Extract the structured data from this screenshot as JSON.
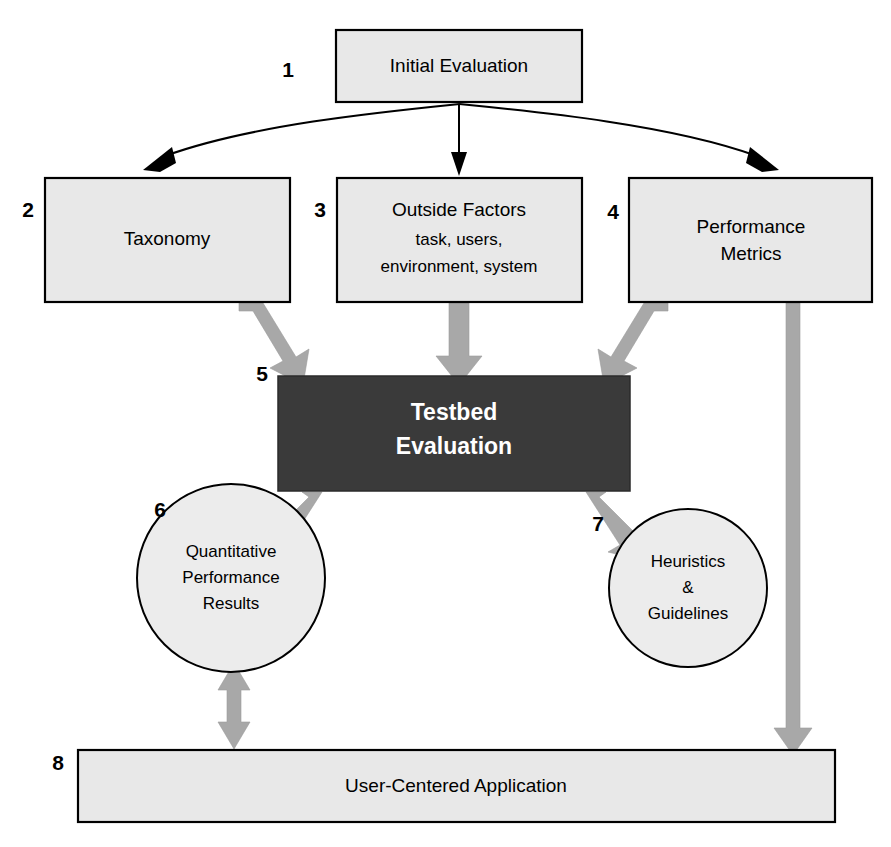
{
  "diagram": {
    "colors": {
      "box_fill": "#e8e8e8",
      "box_stroke": "#000000",
      "dark_box_fill": "#3a3a3a",
      "dark_box_text": "#ffffff",
      "circle_fill": "#ececec",
      "gray_arrow": "#a8a8a8",
      "thin_arrow": "#000000",
      "background": "#ffffff"
    },
    "nodes": [
      {
        "id": "initial-evaluation",
        "step": "1",
        "shape": "rectangle",
        "label": "Initial Evaluation",
        "sublabel": ""
      },
      {
        "id": "taxonomy",
        "step": "2",
        "shape": "rectangle",
        "label": "Taxonomy",
        "sublabel": ""
      },
      {
        "id": "outside-factors",
        "step": "3",
        "shape": "rectangle",
        "label": "Outside Factors",
        "sublabel_line1": "task, users,",
        "sublabel_line2": "environment, system"
      },
      {
        "id": "performance-metrics",
        "step": "4",
        "shape": "rectangle",
        "label_line1": "Performance",
        "label_line2": "Metrics"
      },
      {
        "id": "testbed-evaluation",
        "step": "5",
        "shape": "rectangle-dark",
        "label_line1": "Testbed",
        "label_line2": "Evaluation"
      },
      {
        "id": "quantitative-performance-results",
        "step": "6",
        "shape": "circle",
        "label_line1": "Quantitative",
        "label_line2": "Performance",
        "label_line3": "Results"
      },
      {
        "id": "heuristics-guidelines",
        "step": "7",
        "shape": "circle",
        "label_line1": "Heuristics",
        "label_line2": "&",
        "label_line3": "Guidelines"
      },
      {
        "id": "user-centered-application",
        "step": "8",
        "shape": "rectangle-wide",
        "label": "User-Centered Application",
        "sublabel": ""
      }
    ],
    "edges": [
      {
        "id": "edge-1-2",
        "from": "initial-evaluation",
        "to": "taxonomy",
        "style": "thin-curved",
        "direction": "one-way"
      },
      {
        "id": "edge-1-3",
        "from": "initial-evaluation",
        "to": "outside-factors",
        "style": "thin-straight",
        "direction": "one-way"
      },
      {
        "id": "edge-1-4",
        "from": "initial-evaluation",
        "to": "performance-metrics",
        "style": "thin-curved",
        "direction": "one-way"
      },
      {
        "id": "edge-2-5",
        "from": "taxonomy",
        "to": "testbed-evaluation",
        "style": "thick-gray",
        "direction": "one-way"
      },
      {
        "id": "edge-3-5",
        "from": "outside-factors",
        "to": "testbed-evaluation",
        "style": "thick-gray",
        "direction": "one-way"
      },
      {
        "id": "edge-4-5",
        "from": "performance-metrics",
        "to": "testbed-evaluation",
        "style": "thick-gray",
        "direction": "one-way"
      },
      {
        "id": "edge-5-6",
        "from": "testbed-evaluation",
        "to": "quantitative-performance-results",
        "style": "thick-gray",
        "direction": "one-way"
      },
      {
        "id": "edge-5-7",
        "from": "testbed-evaluation",
        "to": "heuristics-guidelines",
        "style": "thick-gray",
        "direction": "one-way"
      },
      {
        "id": "edge-6-8",
        "from": "quantitative-performance-results",
        "to": "user-centered-application",
        "style": "thick-gray",
        "direction": "two-way"
      },
      {
        "id": "edge-4-8",
        "from": "performance-metrics",
        "to": "user-centered-application",
        "style": "thick-gray",
        "direction": "one-way"
      }
    ]
  }
}
